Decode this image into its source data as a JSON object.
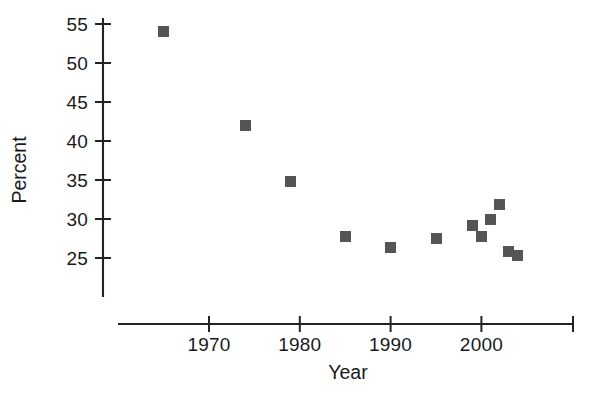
{
  "chart_data": {
    "type": "scatter",
    "title": "",
    "xlabel": "Year",
    "ylabel": "Percent",
    "xlim": [
      1963,
      2010
    ],
    "ylim": [
      21,
      56.5
    ],
    "xticks": [
      1970,
      1980,
      1990,
      2000
    ],
    "xtick_labels": [
      "1970",
      "1980",
      "1990",
      "2000"
    ],
    "yticks": [
      25,
      30,
      35,
      40,
      45,
      50,
      55
    ],
    "ytick_labels": [
      "25",
      "30",
      "35",
      "40",
      "45",
      "50",
      "55"
    ],
    "grid": false,
    "legend": null,
    "marker": {
      "shape": "square",
      "color": "#555555",
      "size": 11
    },
    "axis_color": "#222222",
    "x": [
      1965,
      1974,
      1979,
      1985,
      1990,
      1995,
      1999,
      2000,
      2001,
      2002,
      2003,
      2004
    ],
    "y": [
      54.0,
      42.0,
      34.8,
      27.8,
      26.3,
      27.5,
      29.2,
      27.7,
      30.0,
      31.9,
      25.8,
      25.3
    ],
    "points": [
      {
        "x": 1965,
        "y": 54.0
      },
      {
        "x": 1974,
        "y": 42.0
      },
      {
        "x": 1979,
        "y": 34.8
      },
      {
        "x": 1985,
        "y": 27.8
      },
      {
        "x": 1990,
        "y": 26.3
      },
      {
        "x": 1995,
        "y": 27.5
      },
      {
        "x": 1999,
        "y": 29.2
      },
      {
        "x": 2000,
        "y": 27.7
      },
      {
        "x": 2001,
        "y": 30.0
      },
      {
        "x": 2002,
        "y": 31.9
      },
      {
        "x": 2003,
        "y": 25.8
      },
      {
        "x": 2004,
        "y": 25.3
      }
    ]
  }
}
